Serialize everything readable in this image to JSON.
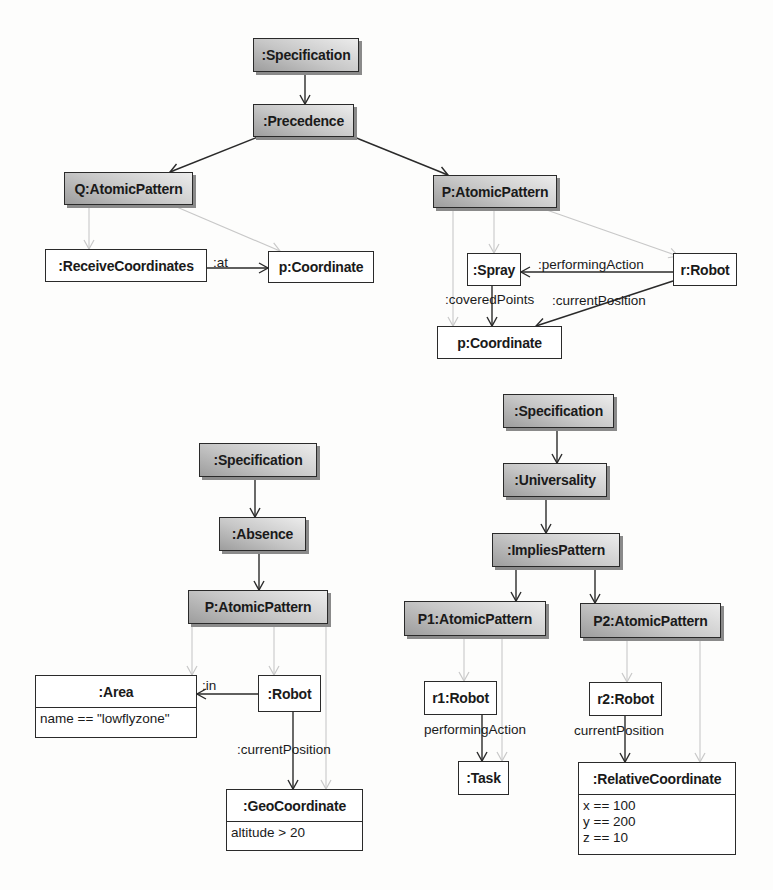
{
  "diagrams": {
    "precedence": {
      "nodes": {
        "spec": ":Specification",
        "precedence": ":Precedence",
        "q_pattern": "Q:AtomicPattern",
        "p_pattern": "P:AtomicPattern",
        "receive": ":ReceiveCoordinates",
        "coord_left": "p:Coordinate",
        "spray": ":Spray",
        "robot": "r:Robot",
        "coord_bottom": "p:Coordinate"
      },
      "edge_labels": {
        "at": ":at",
        "performing_action": ":performingAction",
        "covered_points": ":coveredPoints",
        "current_position": ":currentPosition"
      }
    },
    "absence": {
      "nodes": {
        "spec": ":Specification",
        "absence": ":Absence",
        "p_pattern": "P:AtomicPattern",
        "area": ":Area",
        "area_attr": "name == \"lowflyzone\"",
        "robot": ":Robot",
        "geo": ":GeoCoordinate",
        "geo_attr": "altitude > 20"
      },
      "edge_labels": {
        "in": ":in",
        "current_position": ":currentPosition"
      }
    },
    "universality": {
      "nodes": {
        "spec": ":Specification",
        "universality": ":Universality",
        "implies": ":ImpliesPattern",
        "p1_pattern": "P1:AtomicPattern",
        "p2_pattern": "P2:AtomicPattern",
        "r1": "r1:Robot",
        "r2": "r2:Robot",
        "task": ":Task",
        "relcoord": ":RelativeCoordinate",
        "relcoord_attrs": "x == 100\ny == 200\nz == 10"
      },
      "edge_labels": {
        "performing_action": "performingAction",
        "current_position": "currentPosition"
      }
    }
  },
  "colors": {
    "edge_dark": "#2a2a2a",
    "edge_light": "#c8c8c8",
    "pattern_fill_dark": "#9d9d9d",
    "pattern_fill_light": "#ececec"
  }
}
